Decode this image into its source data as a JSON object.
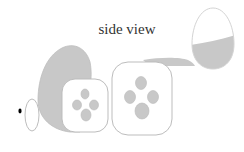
{
  "diagram": {
    "title": "side view",
    "colors": {
      "fill_gray": "#c8c8c8",
      "outline": "#bdbdbd",
      "background": "#ffffff",
      "dot": "#000000"
    },
    "elements": [
      {
        "name": "black-dot",
        "type": "point"
      },
      {
        "name": "small-ellipse",
        "type": "outline-ellipse"
      },
      {
        "name": "gray-egg-back",
        "type": "filled-shape"
      },
      {
        "name": "rounded-square-small",
        "type": "rounded-square",
        "spots": 4
      },
      {
        "name": "rounded-square-large",
        "type": "rounded-square",
        "spots": 4
      },
      {
        "name": "gray-wedge",
        "type": "filled-shape"
      },
      {
        "name": "half-filled-egg",
        "type": "egg",
        "fill": "bottom-half"
      }
    ]
  }
}
